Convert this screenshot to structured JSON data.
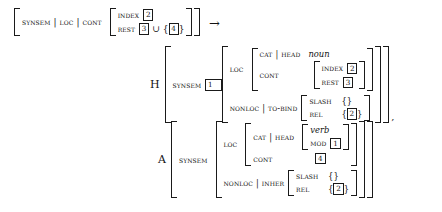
{
  "figure": {
    "kind": "hpsg-avm-rule",
    "arrow": "→",
    "comma": ",",
    "union": "∪",
    "pathsep": "|",
    "empty_set": "{}"
  },
  "mother": {
    "path": {
      "f1": "SYNSEM",
      "f2": "LOC",
      "f3": "CONT"
    },
    "cont": {
      "index": {
        "feature": "INDEX",
        "tag": "2"
      },
      "rest": {
        "feature": "REST",
        "tag": "3",
        "op": "∪",
        "set_open": "{",
        "set_tag": "4",
        "set_close": "}"
      }
    }
  },
  "daughters": [
    {
      "label": "H",
      "synsem": {
        "feature": "SYNSEM",
        "tag": "1"
      },
      "loc": {
        "feature": "LOC",
        "cat": {
          "f1": "CAT",
          "f2": "HEAD",
          "type": "noun"
        },
        "cont": {
          "feature": "CONT",
          "index": {
            "feature": "INDEX",
            "tag": "2"
          },
          "rest": {
            "feature": "REST",
            "tag": "3"
          }
        }
      },
      "nonloc": {
        "f1": "NONLOC",
        "f2": "TO-BIND",
        "slash": {
          "feature": "SLASH",
          "value": "{}"
        },
        "rel": {
          "feature": "REL",
          "set_open": "{",
          "tag": "2",
          "set_close": "}"
        }
      },
      "trailing": ","
    },
    {
      "label": "A",
      "synsem": {
        "feature": "SYNSEM",
        "tag": ""
      },
      "loc": {
        "feature": "LOC",
        "cat": {
          "f1": "CAT",
          "f2": "HEAD",
          "type": "verb",
          "mod": {
            "feature": "MOD",
            "tag": "1"
          }
        },
        "cont": {
          "feature": "CONT",
          "tag": "4"
        }
      },
      "nonloc": {
        "f1": "NONLOC",
        "f2": "INHER",
        "slash": {
          "feature": "SLASH",
          "value": "{}"
        },
        "rel": {
          "feature": "REL",
          "set_open": "{",
          "tag": "2",
          "set_close": "}"
        }
      },
      "trailing": ""
    }
  ]
}
